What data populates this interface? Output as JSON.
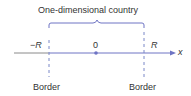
{
  "diagram": {
    "title": "One-dimensional country",
    "axis_label": "x",
    "left_mark": "−R",
    "center_mark": "0",
    "right_mark": "R",
    "left_border_label": "Border",
    "right_border_label": "Border",
    "colors": {
      "axis": "#6e74c4",
      "brace": "#6e74c4",
      "border_dash": "#7a88c8",
      "text": "#333333",
      "axis_left_gray": "#8a8a8a"
    }
  }
}
